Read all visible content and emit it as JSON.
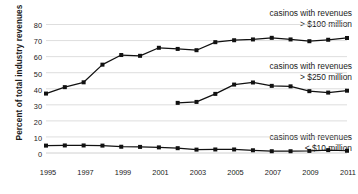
{
  "chart_data": {
    "type": "line",
    "title": "",
    "subtitle": "",
    "xlabel": "",
    "ylabel": "Percent of total industry revenues",
    "x": [
      1995,
      1996,
      1997,
      1998,
      1999,
      2000,
      2001,
      2002,
      2003,
      2004,
      2005,
      2006,
      2007,
      2008,
      2009,
      2010,
      2011
    ],
    "xlim": [
      1995,
      2011
    ],
    "ylim": [
      0,
      80
    ],
    "y_ticks": [
      0,
      10,
      20,
      30,
      40,
      50,
      60,
      70,
      80
    ],
    "x_ticks": [
      1995,
      1997,
      1999,
      2001,
      2003,
      2005,
      2007,
      2009,
      2011
    ],
    "x_tick_labels": [
      "1995",
      "1997",
      "1999",
      "2001",
      "2003",
      "2005",
      "2007",
      "2009",
      "2011"
    ],
    "y_tick_labels": [
      "0",
      "10",
      "20",
      "30",
      "40",
      "50",
      "60",
      "70",
      "80"
    ],
    "grid": true,
    "grid_axis": "y",
    "legend": "annotations-inline",
    "marker": "square",
    "line_color": "#111111",
    "grid_color": "#d0d0d0",
    "series": [
      {
        "name": "casinos with revenues > $100 million",
        "label_line1": "casinos with revenues",
        "label_line2": "> $100 million",
        "x": [
          1995,
          1996,
          1997,
          1998,
          1999,
          2000,
          2001,
          2002,
          2003,
          2004,
          2005,
          2006,
          2007,
          2008,
          2009,
          2010,
          2011
        ],
        "values": [
          37,
          41,
          44,
          55,
          61,
          60.5,
          65.5,
          64.8,
          64,
          69,
          70.2,
          70.7,
          71.7,
          70.7,
          69.6,
          70.5,
          71.6
        ]
      },
      {
        "name": "casinos with revenues > $250 million",
        "label_line1": "casinos with revenues",
        "label_line2": "> $250 million",
        "x": [
          2002,
          2003,
          2004,
          2005,
          2006,
          2007,
          2008,
          2009,
          2010,
          2011
        ],
        "values": [
          31.2,
          31.8,
          36.8,
          42.6,
          43.9,
          41.8,
          41.5,
          38.5,
          37.6,
          38.8
        ]
      },
      {
        "name": "casinos with revenues < $10 million",
        "label_line1": "casinos with revenues",
        "label_line2": "< $10 million",
        "x": [
          1995,
          1996,
          1997,
          1998,
          1999,
          2000,
          2001,
          2002,
          2003,
          2004,
          2005,
          2006,
          2007,
          2008,
          2009,
          2010,
          2011
        ],
        "values": [
          4.6,
          4.7,
          4.7,
          4.6,
          3.9,
          3.8,
          3.5,
          3.0,
          2.1,
          2.2,
          2.2,
          1.7,
          1.1,
          1.1,
          1.3,
          1.8,
          1.4
        ]
      }
    ],
    "annotations": [
      {
        "id": "annotation-100m",
        "line1": "casinos with revenues",
        "line2": "> $100 million"
      },
      {
        "id": "annotation-250m",
        "line1": "casinos with revenues",
        "line2": "> $250 million"
      },
      {
        "id": "annotation-10m",
        "line1": "casinos with revenues",
        "line2": "< $10 million"
      }
    ]
  }
}
